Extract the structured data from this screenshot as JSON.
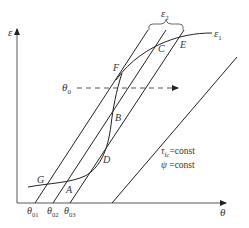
{
  "figure": {
    "axes": {
      "y_label": "ε",
      "x_label": "θ"
    },
    "points": {
      "A": "A",
      "B": "B",
      "C": "C",
      "D": "D",
      "E": "E",
      "F": "F",
      "G": "G"
    },
    "curve_labels": {
      "epsilon1": "ε",
      "epsilon1_sub": "1",
      "epsilon2": "ε",
      "epsilon2_sub": "2",
      "theta0": "θ",
      "theta0_sub": "0"
    },
    "x_ticks": [
      {
        "main": "θ",
        "sub": "01"
      },
      {
        "main": "θ",
        "sub": "02"
      },
      {
        "main": "θ",
        "sub": "03"
      }
    ],
    "annotations": {
      "tau_symbol": "τ",
      "tau_sub": "fc",
      "tau_rest": "=const",
      "psi_symbol": "ψ",
      "psi_rest": " =const"
    },
    "colors": {
      "line": "#222222",
      "text": "#333333",
      "background": "#ffffff"
    }
  }
}
